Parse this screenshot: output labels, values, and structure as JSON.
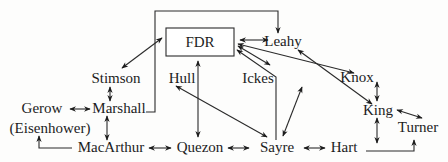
{
  "diagram": {
    "title": "",
    "nodes": [
      {
        "id": "fdr",
        "label": "FDR",
        "x": 200,
        "y": 47,
        "boxed": true
      },
      {
        "id": "leahy",
        "label": "Leahy",
        "x": 283,
        "y": 47
      },
      {
        "id": "stimson",
        "label": "Stimson",
        "x": 118,
        "y": 83
      },
      {
        "id": "hull",
        "label": "Hull",
        "x": 182,
        "y": 83
      },
      {
        "id": "ickes",
        "label": "Ickes",
        "x": 259,
        "y": 83
      },
      {
        "id": "knox",
        "label": "Knox",
        "x": 357,
        "y": 82
      },
      {
        "id": "gerow",
        "label": "Gerow",
        "x": 42,
        "y": 113
      },
      {
        "id": "eisenhower",
        "label": "(Eisenhower)",
        "x": 50,
        "y": 134
      },
      {
        "id": "marshall",
        "label": "Marshall",
        "x": 118,
        "y": 113
      },
      {
        "id": "king",
        "label": "King",
        "x": 378,
        "y": 115
      },
      {
        "id": "turner",
        "label": "Turner",
        "x": 418,
        "y": 132
      },
      {
        "id": "macarthur",
        "label": "MacArthur",
        "x": 112,
        "y": 152
      },
      {
        "id": "quezon",
        "label": "Quezon",
        "x": 200,
        "y": 152
      },
      {
        "id": "sayre",
        "label": "Sayre",
        "x": 277,
        "y": 152
      },
      {
        "id": "hart",
        "label": "Hart",
        "x": 342,
        "y": 152
      }
    ],
    "edges": [
      {
        "from": "fdr",
        "to": "leahy",
        "type": "bidirectional"
      },
      {
        "from": "fdr",
        "to": "stimson",
        "type": "bidirectional"
      },
      {
        "from": "fdr",
        "to": "quezon",
        "type": "bidirectional"
      },
      {
        "from": "fdr",
        "to": "ickes",
        "type": "bidirectional"
      },
      {
        "from": "fdr",
        "to": "knox",
        "type": "bidirectional"
      },
      {
        "from": "fdr",
        "to": "king",
        "type": "bidirectional"
      },
      {
        "from": "sayre",
        "to": "fdr",
        "type": "directed"
      },
      {
        "from": "marshall",
        "to": "leahy",
        "type": "directed",
        "route": "bracket-top"
      },
      {
        "from": "stimson",
        "to": "marshall",
        "type": "bidirectional"
      },
      {
        "from": "gerow",
        "to": "marshall",
        "type": "bidirectional"
      },
      {
        "from": "marshall",
        "to": "macarthur",
        "type": "bidirectional"
      },
      {
        "from": "macarthur",
        "to": "eisenhower",
        "type": "directed",
        "route": "elbow"
      },
      {
        "from": "macarthur",
        "to": "quezon",
        "type": "bidirectional"
      },
      {
        "from": "quezon",
        "to": "sayre",
        "type": "bidirectional"
      },
      {
        "from": "hull",
        "to": "sayre",
        "type": "bidirectional"
      },
      {
        "from": "ickes",
        "to": "sayre",
        "type": "bidirectional"
      },
      {
        "from": "sayre",
        "to": "hart",
        "type": "bidirectional"
      },
      {
        "from": "knox",
        "to": "king",
        "type": "bidirectional"
      },
      {
        "from": "king",
        "to": "turner",
        "type": "bidirectional"
      },
      {
        "from": "king",
        "to": "hart",
        "type": "bidirectional"
      },
      {
        "from": "hart",
        "to": "turner",
        "type": "directed",
        "route": "elbow"
      }
    ]
  }
}
